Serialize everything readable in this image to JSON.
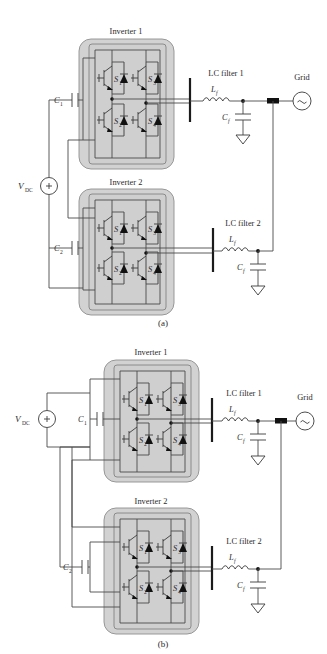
{
  "figure": {
    "title_semantic": "two-parallel-inverter-grid-connection-configurations",
    "subfigures": [
      {
        "id": "a",
        "caption": "(a)",
        "source": {
          "label_main": "V",
          "label_sub": "DC",
          "polarity": "+",
          "type": "dc-voltage-source"
        },
        "dc_link_capacitors": [
          {
            "label_main": "C",
            "label_sub": "1"
          },
          {
            "label_main": "C",
            "label_sub": "2"
          }
        ],
        "inverters": [
          {
            "title": "Inverter 1",
            "switches": [
              {
                "label_main": "S",
                "label_sub": "1",
                "position": "upper-left"
              },
              {
                "label_main": "S",
                "label_sub": "3",
                "position": "upper-right"
              },
              {
                "label_main": "S",
                "label_sub": "2",
                "position": "lower-left"
              },
              {
                "label_main": "S",
                "label_sub": "4",
                "position": "lower-right"
              }
            ]
          },
          {
            "title": "Inverter 2",
            "switches": [
              {
                "label_main": "S",
                "label_sub": "1",
                "position": "upper-left"
              },
              {
                "label_main": "S",
                "label_sub": "3",
                "position": "upper-right"
              },
              {
                "label_main": "S",
                "label_sub": "2",
                "position": "lower-left"
              },
              {
                "label_main": "S",
                "label_sub": "4",
                "position": "lower-right"
              }
            ]
          }
        ],
        "filters": [
          {
            "title": "LC filter 1",
            "inductor": {
              "label_main": "L",
              "label_sub": "f"
            },
            "capacitor": {
              "label_main": "C",
              "label_sub": "f"
            }
          },
          {
            "title": "LC filter 2",
            "inductor": {
              "label_main": "L",
              "label_sub": "f"
            },
            "capacitor": {
              "label_main": "C",
              "label_sub": "f"
            }
          }
        ],
        "grid": {
          "label": "Grid",
          "symbol": "~",
          "type": "ac-source"
        }
      },
      {
        "id": "b",
        "caption": "(b)",
        "source": {
          "label_main": "V",
          "label_sub": "DC",
          "polarity": "+",
          "type": "dc-voltage-source"
        },
        "dc_link_capacitors": [
          {
            "label_main": "C",
            "label_sub": "1"
          },
          {
            "label_main": "C",
            "label_sub": "2"
          }
        ],
        "inverters": [
          {
            "title": "Inverter 1",
            "switches": [
              {
                "label_main": "S",
                "label_sub": "1",
                "position": "upper-left"
              },
              {
                "label_main": "S",
                "label_sub": "3",
                "position": "upper-right"
              },
              {
                "label_main": "S",
                "label_sub": "2",
                "position": "lower-left"
              },
              {
                "label_main": "S",
                "label_sub": "4",
                "position": "lower-right"
              }
            ]
          },
          {
            "title": "Inverter 2",
            "switches": [
              {
                "label_main": "S",
                "label_sub": "1",
                "position": "upper-left"
              },
              {
                "label_main": "S",
                "label_sub": "3",
                "position": "upper-right"
              },
              {
                "label_main": "S",
                "label_sub": "2",
                "position": "lower-left"
              },
              {
                "label_main": "S",
                "label_sub": "4",
                "position": "lower-right"
              }
            ]
          }
        ],
        "filters": [
          {
            "title": "LC filter 1",
            "inductor": {
              "label_main": "L",
              "label_sub": "f"
            },
            "capacitor": {
              "label_main": "C",
              "label_sub": "f"
            }
          },
          {
            "title": "LC filter 2",
            "inductor": {
              "label_main": "L",
              "label_sub": "f"
            },
            "capacitor": {
              "label_main": "C",
              "label_sub": "f"
            }
          }
        ],
        "grid": {
          "label": "Grid",
          "symbol": "~",
          "type": "ac-source"
        }
      }
    ],
    "colors": {
      "page_background": "#ffffff",
      "inverter_block_fill": "#d2d2d2",
      "inverter_block_border": "#8e8e8e",
      "wire": "#4a4a4a",
      "device": "#3a3a3a",
      "text": "#2b2b2b",
      "junction": "#111111"
    }
  }
}
